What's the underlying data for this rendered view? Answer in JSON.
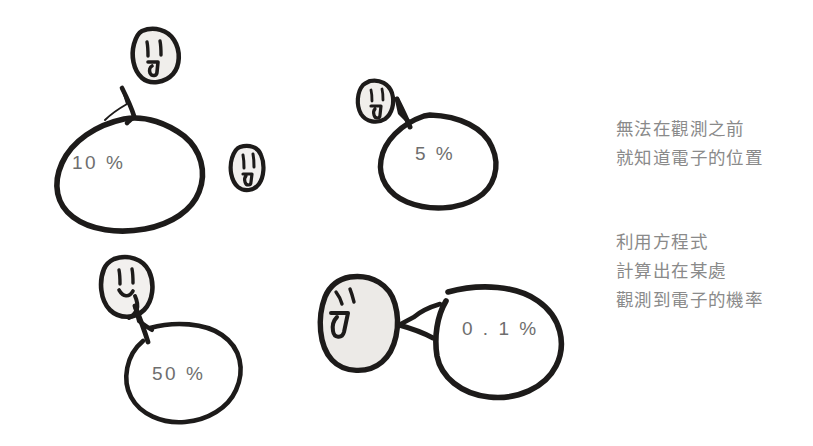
{
  "figure": {
    "type": "hand-drawn-illustration",
    "background_color": "#ffffff",
    "ink_color": "#1d1b1a",
    "face_fill_color": "#eceae7",
    "label_color": "#6e6e6e",
    "caption_color": "#8a8a8a"
  },
  "bubbles": [
    {
      "id": "bubble-10",
      "label": "10 %",
      "x": 72,
      "y": 152
    },
    {
      "id": "bubble-5",
      "label": "5 %",
      "x": 415,
      "y": 143
    },
    {
      "id": "bubble-50",
      "label": "50 %",
      "x": 152,
      "y": 363
    },
    {
      "id": "bubble-01",
      "label": "0 . 1 %",
      "x": 462,
      "y": 318
    }
  ],
  "faces": [
    {
      "id": "face-top-left",
      "expression": "neutral-open-mouth"
    },
    {
      "id": "face-middle-small",
      "expression": "neutral-small"
    },
    {
      "id": "face-upper-right",
      "expression": "neutral-open-mouth"
    },
    {
      "id": "face-lower-left",
      "expression": "smiling"
    },
    {
      "id": "face-lower-right",
      "expression": "open-mouth-side"
    }
  ],
  "captions": [
    {
      "id": "caption-upper",
      "lines": [
        "無法在觀測之前",
        "就知道電子的位置"
      ]
    },
    {
      "id": "caption-lower",
      "lines": [
        "利用方程式",
        "計算出在某處",
        "觀測到電子的機率"
      ]
    }
  ]
}
